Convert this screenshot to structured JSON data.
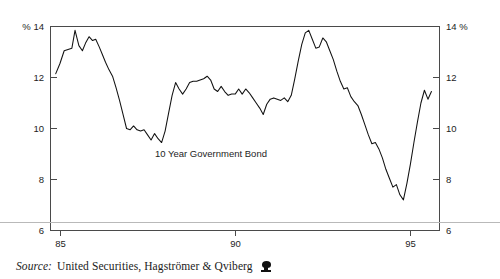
{
  "figure": {
    "series_annotation": "10 Year Government Bond",
    "source_label": "Source:",
    "source_text": "United Securities, Hagströmer & Qviberg",
    "logo_icon": "publisher-logo-icon",
    "line_color": "#111111",
    "frame_color": "#4a4a4a",
    "rule_color": "#b9b9b9",
    "background": "#ffffff"
  },
  "chart_data": {
    "type": "line",
    "title": "",
    "annotations": [
      "10 Year Government Bond"
    ],
    "xlabel": "",
    "ylabel": "",
    "left_axis_unit": "% 14",
    "right_axis_unit": "14 %",
    "xlim": [
      84.45,
      95.55
    ],
    "ylim": [
      6,
      14
    ],
    "grid": false,
    "legend": "none",
    "yticks": [
      6,
      8,
      10,
      12,
      14
    ],
    "ytick_labels_left": [
      "6",
      "8",
      "10",
      "12",
      "% 14"
    ],
    "ytick_labels_right": [
      "6",
      "8",
      "10",
      "12",
      "14 %"
    ],
    "xticks": [
      85,
      90,
      95
    ],
    "xtick_labels": [
      "85",
      "90",
      "95"
    ],
    "series": [
      {
        "name": "10 Year Government Bond",
        "x": [
          84.6,
          84.72,
          84.84,
          84.95,
          85.06,
          85.15,
          85.26,
          85.36,
          85.45,
          85.55,
          85.65,
          85.74,
          85.84,
          85.93,
          86.02,
          86.12,
          86.22,
          86.32,
          86.42,
          86.52,
          86.62,
          86.72,
          86.82,
          86.92,
          87.02,
          87.12,
          87.22,
          87.32,
          87.42,
          87.52,
          87.62,
          87.72,
          87.82,
          87.92,
          88.02,
          88.12,
          88.22,
          88.32,
          88.42,
          88.52,
          88.62,
          88.72,
          88.82,
          88.92,
          89.02,
          89.12,
          89.22,
          89.32,
          89.42,
          89.52,
          89.62,
          89.72,
          89.82,
          89.92,
          90.02,
          90.12,
          90.22,
          90.32,
          90.42,
          90.52,
          90.62,
          90.72,
          90.82,
          90.92,
          91.02,
          91.12,
          91.22,
          91.32,
          91.42,
          91.52,
          91.62,
          91.72,
          91.82,
          91.92,
          92.02,
          92.12,
          92.22,
          92.32,
          92.42,
          92.52,
          92.62,
          92.72,
          92.82,
          92.92,
          93.02,
          93.12,
          93.22,
          93.32,
          93.42,
          93.52,
          93.62,
          93.72,
          93.82,
          93.92,
          94.02,
          94.12,
          94.22,
          94.32,
          94.42,
          94.52,
          94.62,
          94.72,
          94.82,
          94.92,
          95.02,
          95.12,
          95.22,
          95.32
        ],
        "y": [
          12.15,
          12.55,
          13.05,
          13.1,
          13.15,
          13.85,
          13.25,
          13.05,
          13.35,
          13.6,
          13.45,
          13.5,
          13.2,
          12.9,
          12.6,
          12.3,
          12.05,
          11.6,
          11.1,
          10.55,
          10.0,
          9.95,
          10.1,
          9.95,
          9.9,
          9.95,
          9.75,
          9.55,
          9.8,
          9.6,
          9.45,
          9.9,
          10.6,
          11.3,
          11.8,
          11.55,
          11.35,
          11.55,
          11.8,
          11.85,
          11.85,
          11.9,
          11.95,
          12.05,
          11.9,
          11.55,
          11.45,
          11.65,
          11.45,
          11.3,
          11.35,
          11.35,
          11.55,
          11.35,
          11.55,
          11.4,
          11.2,
          11.0,
          10.8,
          10.55,
          10.95,
          11.15,
          11.2,
          11.15,
          11.1,
          11.2,
          11.05,
          11.3,
          11.95,
          12.65,
          13.3,
          13.75,
          13.85,
          13.5,
          13.15,
          13.2,
          13.55,
          13.4,
          13.05,
          12.7,
          12.25,
          11.85,
          11.55,
          11.6,
          11.25,
          11.05,
          10.9,
          10.55,
          10.15,
          9.75,
          9.4,
          9.45,
          9.2,
          8.85,
          8.4,
          8.05,
          7.7,
          7.8,
          7.4,
          7.2,
          7.85,
          8.6,
          9.45,
          10.25,
          11.0,
          11.5,
          11.15,
          11.45
        ]
      }
    ]
  }
}
